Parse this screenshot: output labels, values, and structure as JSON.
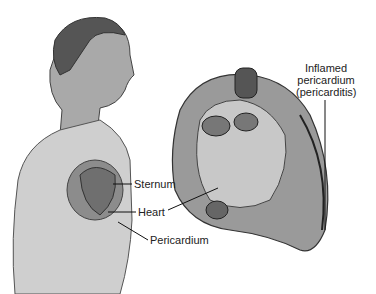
{
  "labels": {
    "inflamed_line1": "Inflamed",
    "inflamed_line2": "pericardium",
    "inflamed_line3": "(pericarditis)",
    "sternum": "Sternum",
    "heart": "Heart",
    "pericardium": "Pericardium"
  }
}
